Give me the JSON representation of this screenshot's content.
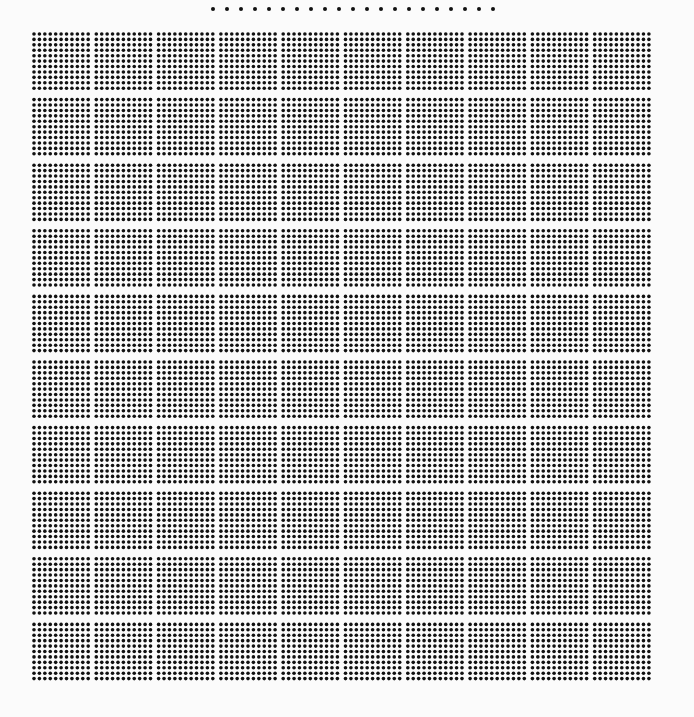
{
  "canvas": {
    "width": 694,
    "height": 717,
    "background_color": "#fbfbfb",
    "dot_color": "#111111"
  },
  "title": "",
  "chart_data": {
    "type": "scatter",
    "title": "",
    "subtitle": "",
    "xlabel": "",
    "ylabel": "",
    "grid": false,
    "legend_position": "none",
    "categories": [],
    "values": [],
    "series": [
      {
        "name": "header-dot-row",
        "role": "top isolated dot row",
        "dot_count": 21,
        "dot_diameter_px": 4,
        "dot_pitch_px": 14,
        "start_x_px": 213,
        "center_y_px": 9,
        "end_x_px": 493
      },
      {
        "name": "dot-block-matrix",
        "role": "main dense grid",
        "blocks_across": 10,
        "blocks_down": 10,
        "total_blocks": 100,
        "dots_per_block_across": 11,
        "dots_per_block_down": 11,
        "dots_per_block": 121,
        "total_dots": 12100,
        "dot_diameter_px": 3.6,
        "dot_pitch_px": 5.42,
        "block_pitch_x_px": 62.3,
        "block_pitch_y_px": 65.6,
        "grid_left_px": 34,
        "grid_top_px": 34,
        "grid_right_px": 658,
        "grid_bottom_px": 690
      }
    ],
    "xlim": [
      0,
      694
    ],
    "ylim": [
      0,
      717
    ]
  },
  "legend": {
    "row_label": "top-dot-row",
    "dot_count_text": "21"
  },
  "grid": {
    "label": "dot-block-matrix",
    "blocks_across_text": "10",
    "blocks_down_text": "10"
  }
}
